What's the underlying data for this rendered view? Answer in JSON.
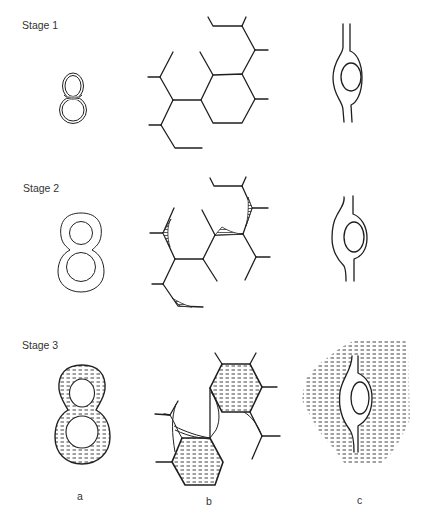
{
  "figure": {
    "stages": [
      {
        "label": "Stage 1"
      },
      {
        "label": "Stage 2"
      },
      {
        "label": "Stage 3"
      }
    ],
    "columns": [
      {
        "label": "a"
      },
      {
        "label": "b"
      },
      {
        "label": "c"
      }
    ],
    "colors": {
      "line": "#1f1f1f",
      "hatch": "#333333",
      "background": "#ffffff",
      "text": "#333333"
    }
  }
}
